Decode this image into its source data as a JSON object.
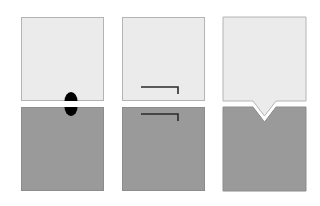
{
  "figure": {
    "canvas": {
      "width": 320,
      "height": 206,
      "background": "#ffffff"
    },
    "title": "Three mating joint configurations",
    "panel_count": 3
  },
  "palette": {
    "background": "#ffffff",
    "upper_block_fill": "#ebebeb",
    "upper_block_stroke": "#b4b4b4",
    "lower_block_fill": "#9a9a9a",
    "lower_block_stroke": "#8c8c8c",
    "feature_line": "#2b2b2b",
    "dowel_fill": "#000000"
  },
  "geometry": {
    "block_width": 83,
    "block_height": 84,
    "upper_block_top": 17,
    "lower_block_top": 107,
    "gap": 6,
    "panel_left_x": [
      21,
      122,
      223
    ]
  },
  "panels": [
    {
      "id": "panel-dowel",
      "index": 1,
      "feature": "dowel-pin",
      "feature_label": "Round dowel pin spanning the joint line",
      "upper_block": {
        "label": "Upper block",
        "x": 21,
        "y": 17,
        "width": 83,
        "height": 84,
        "fill": "#ebebeb",
        "stroke": "#b4b4b4"
      },
      "lower_block": {
        "label": "Lower block",
        "x": 21,
        "y": 107,
        "width": 83,
        "height": 84,
        "fill": "#9a9a9a",
        "stroke": "#8c8c8c"
      },
      "dowel": {
        "label": "Dowel pin",
        "center_x": 71,
        "center_y": 104,
        "radius_x": 6.5,
        "radius_y": 9,
        "fill": "#000000"
      }
    },
    {
      "id": "panel-rabbet",
      "index": 2,
      "feature": "rabbet-step",
      "feature_label": "Stepped rabbet scribe line in each block",
      "upper_block": {
        "label": "Upper block",
        "x": 122,
        "y": 17,
        "width": 83,
        "height": 84,
        "fill": "#ebebeb",
        "stroke": "#b4b4b4"
      },
      "lower_block": {
        "label": "Lower block",
        "x": 122,
        "y": 107,
        "width": 83,
        "height": 84,
        "fill": "#9a9a9a",
        "stroke": "#8c8c8c"
      },
      "upper_step_line": {
        "label": "Upper step line",
        "points": "141,87 178,87 178,94",
        "stroke": "#2b2b2b",
        "stroke_width": 1.6
      },
      "lower_step_line": {
        "label": "Lower step line",
        "points": "141,114 178,114 178,121",
        "stroke": "#2b2b2b",
        "stroke_width": 1.6
      }
    },
    {
      "id": "panel-vee",
      "index": 3,
      "feature": "vee-tongue-and-groove",
      "feature_label": "V tongue on upper block seated in V groove of lower block",
      "upper_block": {
        "label": "Upper block with V tongue",
        "outline": "223,17 306,17 306,101 276,101 264.5,116 253,101 223,101",
        "fill": "#ebebeb",
        "stroke": "#b4b4b4"
      },
      "lower_block": {
        "label": "Lower block with V groove",
        "outline": "223,107 253,107 264.5,122 276,107 306,107 306,191 223,191",
        "fill": "#9a9a9a",
        "stroke": "#8c8c8c"
      },
      "vee": {
        "label": "V notch",
        "apex_x": 264.5,
        "half_width": 11.5,
        "depth": 15
      }
    }
  ]
}
